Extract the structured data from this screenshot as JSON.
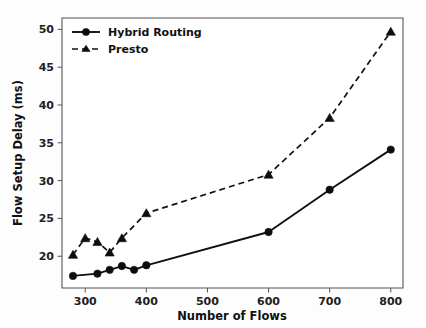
{
  "chart_data": {
    "type": "line",
    "title": "",
    "xlabel": "Number of Flows",
    "ylabel": "Flow Setup Delay (ms)",
    "xlim": [
      262,
      820
    ],
    "ylim": [
      15.8,
      51.5
    ],
    "xticks": [
      300,
      400,
      500,
      600,
      700,
      800
    ],
    "xticklabels": [
      "300",
      "400",
      "500",
      "600",
      "700",
      "800"
    ],
    "yticks": [
      20,
      25,
      30,
      35,
      40,
      45,
      50
    ],
    "yticklabels": [
      "20",
      "25",
      "30",
      "35",
      "40",
      "45",
      "50"
    ],
    "grid": false,
    "legend_position": "upper left",
    "series": [
      {
        "name": "Hybrid Routing",
        "marker": "circle",
        "linestyle": "solid",
        "color": "#101010",
        "x": [
          280,
          320,
          340,
          360,
          380,
          400,
          600,
          700,
          800
        ],
        "values": [
          17.4,
          17.7,
          18.2,
          18.7,
          18.2,
          18.8,
          23.2,
          28.8,
          34.1
        ]
      },
      {
        "name": "Presto",
        "marker": "triangle",
        "linestyle": "dashed",
        "color": "#101010",
        "x": [
          280,
          300,
          320,
          340,
          360,
          400,
          600,
          700,
          800
        ],
        "values": [
          20.2,
          22.4,
          21.9,
          20.5,
          22.4,
          25.7,
          30.8,
          38.3,
          49.7
        ]
      }
    ]
  },
  "axes": {
    "x_title": "Number of Flows",
    "y_title": "Flow Setup Delay (ms)"
  },
  "legend": {
    "entries": [
      {
        "label": "Hybrid Routing"
      },
      {
        "label": "Presto"
      }
    ]
  },
  "ticks": {
    "x": [
      "300",
      "400",
      "500",
      "600",
      "700",
      "800"
    ],
    "y": [
      "20",
      "25",
      "30",
      "35",
      "40",
      "45",
      "50"
    ]
  },
  "colors": {
    "series": "#101010",
    "axis": "#555555",
    "background": "#fdfdfd"
  }
}
